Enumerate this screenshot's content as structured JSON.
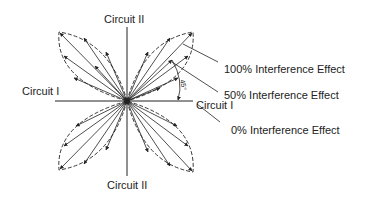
{
  "diagram": {
    "labels": {
      "circuit_ii_top": "Circuit II",
      "circuit_ii_bottom": "Circuit II",
      "circuit_i_left": "Circuit I",
      "circuit_i_right": "Circuit I",
      "angle": "45°",
      "interference_100": "100% Interference Effect",
      "interference_50": "50% Interference Effect",
      "interference_0": "0% Interference Effect"
    },
    "colors": {
      "stroke": "#222222",
      "background": "#ffffff"
    }
  }
}
